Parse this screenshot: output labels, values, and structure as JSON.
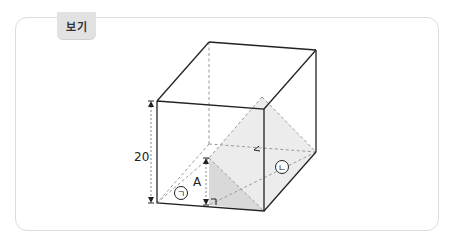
{
  "panel": {
    "tab_label": "보기"
  },
  "figure": {
    "type": "rectangular prism with inscribed pyramid-like shaded section",
    "height_label": "20",
    "inner_height_label": "A",
    "face_labels": {
      "left": "ㄱ",
      "right": "ㄴ"
    },
    "colors": {
      "edge": "#222222",
      "dashed": "#9a9a9a",
      "shade_light": "#ececec",
      "shade_dark": "#d9d9d9",
      "frame_border": "#dcdcdc",
      "tab_bg": "#e2e2e2"
    }
  }
}
